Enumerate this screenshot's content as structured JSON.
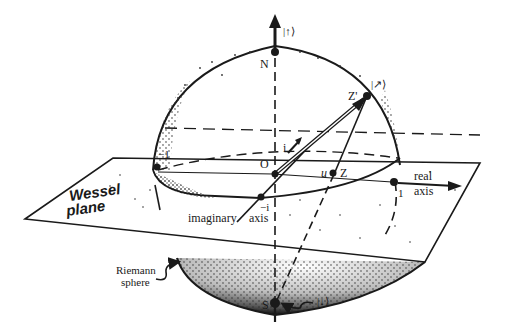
{
  "figure": {
    "type": "diagram",
    "colors": {
      "ink": "#1a1a1a",
      "background": "#ffffff",
      "stipple": "#2a2a2a"
    }
  },
  "labels": {
    "north_state": "|↑⟩",
    "north_pole": "N",
    "south_state": "|↓⟩",
    "south_pole": "S",
    "z_prime_state": "|↗⟩",
    "z_prime": "Z'",
    "z_point": "Z",
    "u_label": "u",
    "origin": "O",
    "i_label": "i",
    "minus_i_label": "−i",
    "one_label": "1",
    "minus_one_label": "−1",
    "real_axis_line1": "real",
    "real_axis_line2": "axis",
    "imaginary_axis": "imaginary",
    "imaginary_axis_word2": "axis",
    "wessel_line1": "Wessel",
    "wessel_line2": "plane",
    "riemann_line1": "Riemann",
    "riemann_line2": "sphere"
  }
}
